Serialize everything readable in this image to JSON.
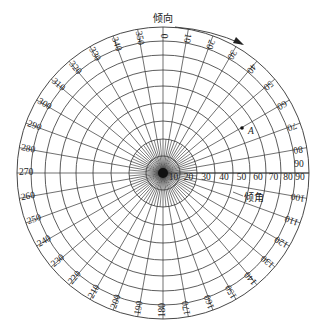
{
  "diagram": {
    "title_direction": "倾向",
    "title_dip": "倾角",
    "point_label": "A",
    "center": {
      "x": 163,
      "y": 173
    },
    "outer_radius": 146,
    "colors": {
      "line": "#333333",
      "text": "#222222",
      "background": "#ffffff"
    },
    "azimuth_labels": [
      "0",
      "10",
      "20",
      "30",
      "40",
      "50",
      "60",
      "70",
      "80",
      "90",
      "100",
      "110",
      "120",
      "130",
      "140",
      "150",
      "160",
      "170",
      "180",
      "190",
      "200",
      "210",
      "220",
      "230",
      "240",
      "250",
      "260",
      "270",
      "280",
      "290",
      "300",
      "310",
      "320",
      "330",
      "340",
      "350"
    ],
    "dip_rings": [
      {
        "label": "10",
        "radius": 17
      },
      {
        "label": "20",
        "radius": 34
      },
      {
        "label": "30",
        "radius": 52
      },
      {
        "label": "40",
        "radius": 70
      },
      {
        "label": "50",
        "radius": 87
      },
      {
        "label": "60",
        "radius": 103
      },
      {
        "label": "70",
        "radius": 118
      },
      {
        "label": "80",
        "radius": 132
      },
      {
        "label": "90",
        "radius": 146
      }
    ],
    "point_A": {
      "azimuth": 60,
      "dip": 50,
      "x": 242,
      "y": 128
    },
    "arrow": {
      "from": {
        "x": 175,
        "y": 27
      },
      "to": {
        "x": 243,
        "y": 45
      }
    }
  }
}
